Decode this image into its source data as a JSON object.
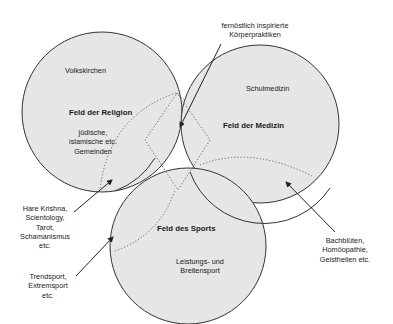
{
  "diagram": {
    "fields": [
      {
        "id": "religion",
        "title": "Feld der Religion",
        "sublabels": [
          "Volkskirchen",
          "jüdische,",
          "islamische etc.",
          "Gemeinden"
        ]
      },
      {
        "id": "medizin",
        "title": "Feld der Medizin",
        "sublabels": [
          "Schulmedizin"
        ]
      },
      {
        "id": "sports",
        "title": "Feld des Sports",
        "sublabels": [
          "Leistungs- und",
          "Breitensport"
        ]
      }
    ],
    "callouts": {
      "fernoestlich": [
        "fernöstlich inspirierte",
        "Körperpraktiken"
      ],
      "hare": [
        "Hare Krishna,",
        "Scientology,",
        "Tarot,",
        "Schamanismus",
        "etc."
      ],
      "trend": [
        "Trendsport,",
        "Extremsport",
        "etc."
      ],
      "bach": [
        "Bachblüten,",
        "Homöopathie,",
        "Geistheilen etc."
      ]
    },
    "colors": {
      "circle_fill": "#e6e6e6",
      "stroke": "#333333",
      "text": "#1a1a1a"
    }
  }
}
